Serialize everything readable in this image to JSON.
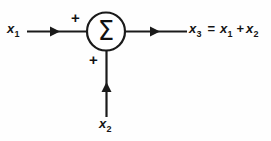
{
  "figure": {
    "type": "block-diagram",
    "name": "summing-junction",
    "background_color": "#fefefe",
    "stroke_color": "#1a1a1a",
    "text_color": "#151515"
  },
  "summing_node": {
    "symbol": "Σ",
    "shape": "circle",
    "center_x": 106,
    "center_y": 31,
    "radius": 19
  },
  "inputs": [
    {
      "id": "input-1",
      "base": "x",
      "subscript": "1",
      "sign": "+",
      "direction": "left-to-right"
    },
    {
      "id": "input-2",
      "base": "x",
      "subscript": "2",
      "sign": "+",
      "direction": "bottom-to-top"
    }
  ],
  "output": {
    "id": "output-1",
    "base": "x",
    "subscript": "3",
    "equals": "=",
    "plus": "+",
    "term_1": {
      "base": "x",
      "subscript": "1"
    },
    "term_2": {
      "base": "x",
      "subscript": "2"
    },
    "expression": "x₃ = x₁ + x₂"
  },
  "icons": {
    "sigma": "sigma-icon",
    "arrow_right": "arrow-right-icon",
    "arrow_up": "arrow-up-icon",
    "plus": "plus-icon"
  }
}
